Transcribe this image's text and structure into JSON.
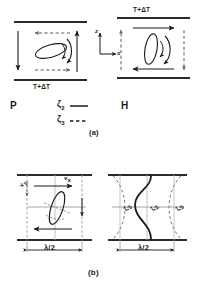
{
  "figure": {
    "caption_a": "(a)",
    "caption_b": "(b)"
  },
  "panel_a": {
    "left": {
      "letter": "P",
      "top_boundary_label": "",
      "bottom_boundary_label": "T+ΔT",
      "name": "parallel-configuration"
    },
    "right": {
      "letter": "H",
      "top_boundary_label": "T+ΔT",
      "bottom_boundary_label": "",
      "name": "perpendicular-configuration"
    },
    "axes": {
      "vertical": "z",
      "horizontal": "x"
    },
    "legend": [
      {
        "symbol": "ζ",
        "subscript": "2",
        "style": "solid"
      },
      {
        "symbol": "ζ",
        "subscript": "3",
        "style": "dashed"
      }
    ]
  },
  "panel_b": {
    "left": {
      "wavelength_label": "λ/2",
      "velocity_label": "v",
      "velocity_sub": "x",
      "edge_label": "v",
      "edge_sub": "z",
      "name": "convection-roll-diagram"
    },
    "right": {
      "wavelength_label": "λ/2",
      "curve_labels": [
        {
          "symbol": "ζ",
          "subscript": "3"
        },
        {
          "symbol": "ζ",
          "subscript": "2"
        },
        {
          "symbol": "ζ",
          "subscript": "3"
        }
      ],
      "name": "director-field-diagram"
    }
  },
  "colors": {
    "ink": "#1a1a1a",
    "rule": "#2b2b2b",
    "dashed": "#6f6f6f",
    "background": "#ffffff"
  }
}
